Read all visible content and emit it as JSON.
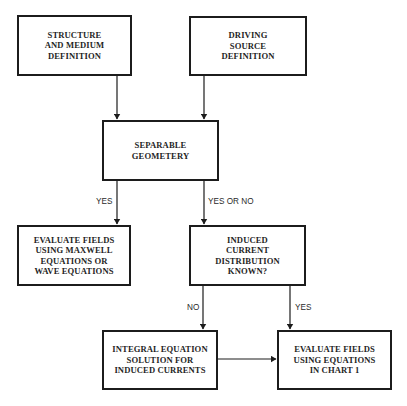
{
  "diagram": {
    "type": "flowchart",
    "nodes": [
      {
        "id": "structure",
        "label": "STRUCTURE\nAND MEDIUM\nDEFINITION"
      },
      {
        "id": "source",
        "label": "DRIVING\nSOURCE\nDEFINITION"
      },
      {
        "id": "separable",
        "label": "SEPARABLE\nGEOMETERY"
      },
      {
        "id": "maxwell",
        "label": "EVALUATE FIELDS\nUSING MAXWELL\nEQUATIONS OR\nWAVE EQUATIONS"
      },
      {
        "id": "induced",
        "label": "INDUCED\nCURRENT\nDISTRIBUTION\nKNOWN?"
      },
      {
        "id": "integral",
        "label": "INTEGRAL EQUATION\nSOLUTION FOR\nINDUCED CURRENTS"
      },
      {
        "id": "chart1",
        "label": "EVALUATE FIELDS\nUSING EQUATIONS\nIN CHART 1"
      }
    ],
    "edges": [
      {
        "from": "structure",
        "to": "separable",
        "label": ""
      },
      {
        "from": "source",
        "to": "separable",
        "label": ""
      },
      {
        "from": "separable",
        "to": "maxwell",
        "label": "YES"
      },
      {
        "from": "separable",
        "to": "induced",
        "label": "YES OR NO"
      },
      {
        "from": "induced",
        "to": "integral",
        "label": "NO"
      },
      {
        "from": "induced",
        "to": "chart1",
        "label": "YES"
      },
      {
        "from": "integral",
        "to": "chart1",
        "label": ""
      }
    ],
    "colors": {
      "line": "#1c1c1c",
      "background": "#ffffff"
    }
  }
}
